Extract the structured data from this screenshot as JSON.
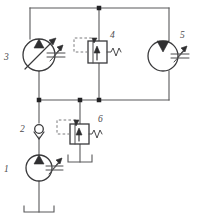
{
  "diagram": {
    "type": "hydraulic-schematic",
    "width": 199,
    "height": 222,
    "background_color": "#ffffff",
    "line_color": "#58585a",
    "component_color": "#3a3a3c",
    "labels": {
      "one": "1",
      "two": "2",
      "three": "3",
      "four": "4",
      "five": "5",
      "six": "6"
    },
    "components": [
      {
        "id": "1",
        "label": "1",
        "name": "fixed-displacement-pump",
        "kind": "pump",
        "variable": false,
        "cx": 39,
        "cy": 168,
        "r": 13
      },
      {
        "id": "2",
        "label": "2",
        "name": "check-valve",
        "kind": "check-valve",
        "cx": 39,
        "cy": 130
      },
      {
        "id": "3",
        "label": "3",
        "name": "variable-displacement-pump",
        "kind": "pump",
        "variable": true,
        "cx": 39,
        "cy": 55,
        "r": 16
      },
      {
        "id": "4",
        "label": "4",
        "name": "pressure-relief-valve-upper",
        "kind": "relief-valve",
        "x": 88,
        "y": 41,
        "w": 19,
        "h": 22
      },
      {
        "id": "5",
        "label": "5",
        "name": "fixed-displacement-motor",
        "kind": "motor",
        "variable": false,
        "cx": 163,
        "cy": 56,
        "r": 15
      },
      {
        "id": "6",
        "label": "6",
        "name": "pressure-relief-valve-lower",
        "kind": "relief-valve",
        "x": 70,
        "y": 124,
        "w": 19,
        "h": 20
      }
    ],
    "junctions": [
      {
        "name": "top-center-junction",
        "x": 99,
        "y": 8
      },
      {
        "name": "mid-left-junction",
        "x": 39,
        "y": 100
      },
      {
        "name": "mid-valve6-junction",
        "x": 80,
        "y": 100
      },
      {
        "name": "mid-center-junction",
        "x": 99,
        "y": 100
      }
    ],
    "reservoirs": [
      {
        "name": "tank-bottom-main",
        "x": 39,
        "y": 210
      },
      {
        "name": "tank-valve6-drain",
        "x": 80,
        "y": 160
      }
    ]
  }
}
